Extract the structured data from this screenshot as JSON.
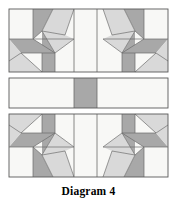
{
  "figure": {
    "caption": "Diagram 4",
    "type": "quilt-block-piecing-diagram",
    "background": "#ffffff"
  },
  "palette": {
    "dark_gray": "#a8a8a8",
    "light_gray": "#d9d9d9",
    "white": "#f8f8f6",
    "outline": "#595959",
    "outline_soft": "#8a8a8a"
  },
  "geometry": {
    "block_left": 9,
    "block_right": 168,
    "band_top_y0": 9,
    "band_top_y1": 72,
    "band_mid_y0": 78,
    "band_mid_y1": 108,
    "band_bottom_y0": 114,
    "band_bottom_y1": 177,
    "center_column_x0": 74,
    "center_column_x1": 97
  },
  "bands": [
    {
      "name": "top-row",
      "description": "Two mirrored half-star units flanking a plain center column",
      "units": [
        "star-unit-left",
        "center-column",
        "star-unit-right"
      ]
    },
    {
      "name": "middle-row",
      "description": "Sashing strip: plain, dark center rectangle, plain",
      "units": [
        "sash-left",
        "sash-center-dark",
        "sash-right"
      ]
    },
    {
      "name": "bottom-row",
      "description": "Vertical mirror of the top row",
      "units": [
        "star-unit-left",
        "center-column",
        "star-unit-right"
      ]
    }
  ]
}
